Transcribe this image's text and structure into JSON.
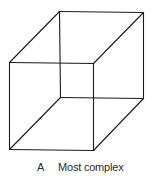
{
  "figure": {
    "type": "necker-cube",
    "stroke_color": "#1a1a1a",
    "stroke_width": 1.1,
    "vertices": {
      "front_top_left": [
        9,
        62
      ],
      "front_top_right": [
        93,
        63
      ],
      "front_bottom_left": [
        9,
        149
      ],
      "front_bottom_right": [
        93,
        150
      ],
      "back_top_left": [
        59,
        11
      ],
      "back_top_right": [
        143,
        12
      ],
      "back_bottom_left": [
        60,
        97
      ],
      "back_bottom_right": [
        143,
        98
      ]
    }
  },
  "caption": {
    "label": "A",
    "text": "Most complex"
  }
}
